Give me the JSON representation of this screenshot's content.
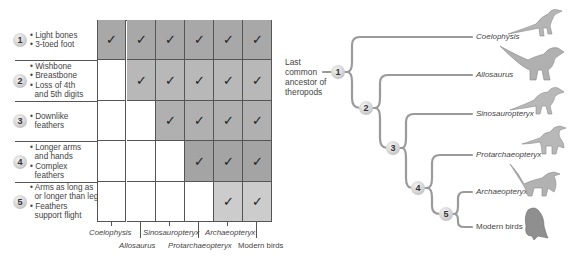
{
  "table": {
    "rows": [
      {
        "number": "1",
        "traits": [
          "• Light bones",
          "• 3-toed foot"
        ],
        "checks": [
          true,
          true,
          true,
          true,
          true,
          true
        ],
        "shade": "#a8a8a8"
      },
      {
        "number": "2",
        "traits": [
          "• Wishbone",
          "• Breastbone",
          "• Loss of 4th",
          "  and 5th digits"
        ],
        "checks": [
          false,
          true,
          true,
          true,
          true,
          true
        ],
        "shade": "#b8b8b8"
      },
      {
        "number": "3",
        "traits": [
          "• Downlike",
          "  feathers"
        ],
        "checks": [
          false,
          false,
          true,
          true,
          true,
          true
        ],
        "shade": "#b0b0b0"
      },
      {
        "number": "4",
        "traits": [
          "• Longer arms",
          "  and hands",
          "• Complex",
          "  feathers"
        ],
        "checks": [
          false,
          false,
          false,
          true,
          true,
          true
        ],
        "shade": "#a4a4a4"
      },
      {
        "number": "5",
        "traits": [
          "• Arms as long as",
          "  or longer than legs",
          "• Feathers",
          "  support flight"
        ],
        "checks": [
          false,
          false,
          false,
          false,
          true,
          true
        ],
        "shade": "#cccccc"
      }
    ],
    "check_glyph": "✓",
    "columns": [
      "Coelophysis",
      "Allosaurus",
      "Sinosauropteryx",
      "Protarchaeopteryx",
      "Archaeopteryx",
      "Modern birds"
    ]
  },
  "tree": {
    "ancestor_label": [
      "Last",
      "common",
      "ancestor of",
      "theropods"
    ],
    "nodes": [
      "1",
      "2",
      "3",
      "4",
      "5"
    ],
    "leaves": [
      "Coelophysis",
      "Allosaurus",
      "Sinosauropteryx",
      "Protarchaeopteryx",
      "Archaeopteryx",
      "Modern birds"
    ],
    "icons": [
      "coelophysis-icon",
      "allosaurus-icon",
      "sinosauropteryx-icon",
      "protarchaeopteryx-icon",
      "archaeopteryx-icon",
      "modern-bird-icon"
    ]
  },
  "colors": {
    "grid_line": "#555555",
    "branch": "#9a9a9a",
    "badge": "#cfcfcf"
  }
}
